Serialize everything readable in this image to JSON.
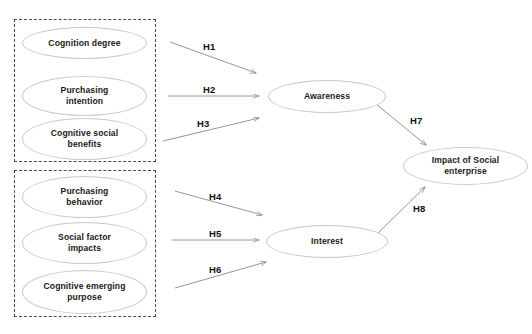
{
  "diagram": {
    "background_color": "#ffffff",
    "node_border_color": "#c9c9c9",
    "group_border_color": "#4a4a4a",
    "edge_color": "#8a8a8a",
    "text_color": "#1a1a1a"
  },
  "groups": [
    {
      "id": "group-awareness-antecedents",
      "label": ""
    },
    {
      "id": "group-interest-antecedents",
      "label": ""
    }
  ],
  "nodes": [
    {
      "id": "cognition-degree",
      "label": "Cognition degree"
    },
    {
      "id": "purchasing-intention",
      "label": "Purchasing\nintention"
    },
    {
      "id": "cognitive-social-benefits",
      "label": "Cognitive social\nbenefits"
    },
    {
      "id": "purchasing-behavior",
      "label": "Purchasing\nbehavior"
    },
    {
      "id": "social-factor-impacts",
      "label": "Social factor\nimpacts"
    },
    {
      "id": "cognitive-emerging-purpose",
      "label": "Cognitive emerging\npurpose"
    },
    {
      "id": "awareness",
      "label": "Awareness"
    },
    {
      "id": "interest",
      "label": "Interest"
    },
    {
      "id": "impact-of-social-enterprise",
      "label": "Impact of Social\nenterprise"
    }
  ],
  "edges": [
    {
      "id": "h1",
      "label": "H1",
      "from": "cognition-degree",
      "to": "awareness"
    },
    {
      "id": "h2",
      "label": "H2",
      "from": "purchasing-intention",
      "to": "awareness"
    },
    {
      "id": "h3",
      "label": "H3",
      "from": "cognitive-social-benefits",
      "to": "awareness"
    },
    {
      "id": "h4",
      "label": "H4",
      "from": "purchasing-behavior",
      "to": "interest"
    },
    {
      "id": "h5",
      "label": "H5",
      "from": "social-factor-impacts",
      "to": "interest"
    },
    {
      "id": "h6",
      "label": "H6",
      "from": "cognitive-emerging-purpose",
      "to": "interest"
    },
    {
      "id": "h7",
      "label": "H7",
      "from": "awareness",
      "to": "impact-of-social-enterprise"
    },
    {
      "id": "h8",
      "label": "H8",
      "from": "interest",
      "to": "impact-of-social-enterprise"
    }
  ]
}
